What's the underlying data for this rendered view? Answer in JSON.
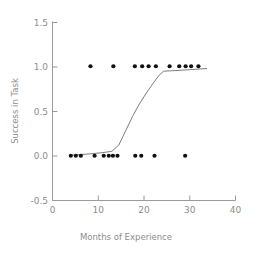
{
  "chart_data": {
    "type": "scatter",
    "title": "",
    "xlabel": "Months of Experience",
    "ylabel": "Success in Task",
    "xlim": [
      0,
      40
    ],
    "ylim": [
      -0.5,
      1.5
    ],
    "xticks": [
      0,
      10,
      20,
      30,
      40
    ],
    "xtick_labels": [
      "0",
      "10",
      "20",
      "30",
      "40"
    ],
    "yticks": [
      -0.5,
      0.0,
      0.5,
      1.0,
      1.5
    ],
    "ytick_labels": [
      "-0.5",
      "0.0",
      "0.5",
      "1.0",
      "1.5"
    ],
    "grid": false,
    "legend": false,
    "series": [
      {
        "name": "observations",
        "type": "scatter",
        "marker": "filled-circle",
        "color": "#111111",
        "points": [
          [
            4.0,
            0.0
          ],
          [
            5.1,
            0.0
          ],
          [
            6.2,
            0.0
          ],
          [
            8.3,
            1.0
          ],
          [
            9.2,
            0.0
          ],
          [
            11.2,
            0.0
          ],
          [
            12.3,
            0.0
          ],
          [
            13.2,
            0.0
          ],
          [
            14.2,
            0.0
          ],
          [
            13.3,
            1.0
          ],
          [
            18.0,
            1.0
          ],
          [
            19.6,
            1.0
          ],
          [
            21.0,
            1.0
          ],
          [
            18.1,
            0.0
          ],
          [
            19.4,
            0.0
          ],
          [
            22.6,
            1.0
          ],
          [
            22.3,
            0.0
          ],
          [
            25.6,
            1.0
          ],
          [
            27.7,
            1.0
          ],
          [
            29.1,
            1.0
          ],
          [
            30.3,
            1.0
          ],
          [
            31.9,
            1.0
          ],
          [
            29.0,
            0.0
          ]
        ]
      },
      {
        "name": "logistic-fit",
        "type": "line",
        "color": "#7d7d7d",
        "points": [
          [
            3.6,
            0.005
          ],
          [
            8.0,
            0.02
          ],
          [
            11.0,
            0.035
          ],
          [
            13.0,
            0.05
          ],
          [
            14.5,
            0.12
          ],
          [
            16.0,
            0.28
          ],
          [
            17.5,
            0.44
          ],
          [
            19.0,
            0.58
          ],
          [
            20.5,
            0.7
          ],
          [
            22.0,
            0.81
          ],
          [
            23.3,
            0.9
          ],
          [
            24.3,
            0.945
          ],
          [
            27.0,
            0.952
          ],
          [
            30.0,
            0.962
          ],
          [
            33.8,
            0.975
          ]
        ]
      }
    ]
  }
}
